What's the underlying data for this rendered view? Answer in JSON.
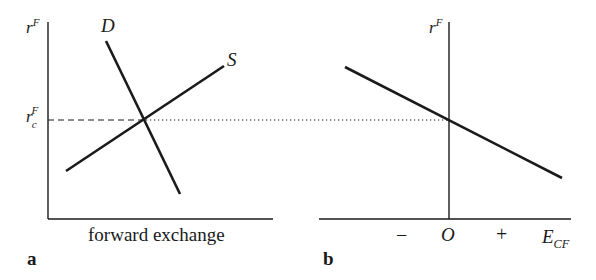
{
  "panel_a": {
    "label": "a",
    "y_axis_label": "r",
    "y_axis_sup": "F",
    "x_axis_label": "forward exchange",
    "demand_label": "D",
    "supply_label": "S",
    "equilibrium_label": "r",
    "equilibrium_sub": "c",
    "equilibrium_sup": "F"
  },
  "panel_b": {
    "label": "b",
    "y_axis_label": "r",
    "y_axis_sup": "F",
    "x_axis_label": "E",
    "x_axis_sub": "CF",
    "tick_minus": "−",
    "tick_origin": "O",
    "tick_plus": "+"
  },
  "colors": {
    "line": "#1a1a1a",
    "background": "#ffffff"
  }
}
